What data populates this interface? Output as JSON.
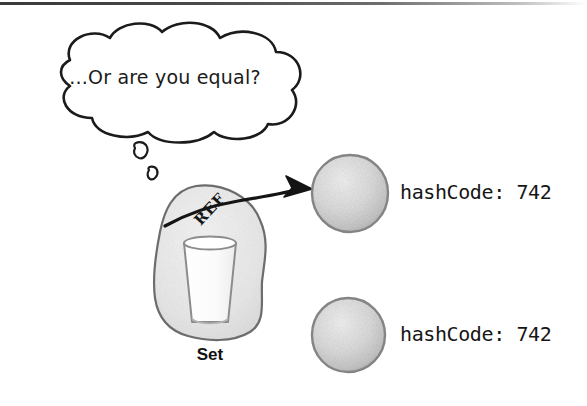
{
  "figure": {
    "kind": "hand-drawn-illustration",
    "caption_text": "...Or are you equal?",
    "set_label": "Set",
    "reference_label": "REF",
    "objects": [
      {
        "id": "object-top",
        "label": "hashCode: 742"
      },
      {
        "id": "object-bottom",
        "label": "hashCode: 742"
      }
    ]
  },
  "thought_bubble": {
    "text": "...Or are you equal?",
    "trail_bubbles": 2
  },
  "set_container": {
    "label": "Set",
    "contains_reference_label": "REF"
  },
  "arrow": {
    "name": "reference-arrow",
    "from": "REF in Set",
    "to": "object-top"
  },
  "colors": {
    "ink": "#1b1b1b",
    "blob_fill": "#ededed",
    "blob_stroke": "#6f6f6f",
    "circle_fill": "#dedede",
    "circle_stroke": "#8a8a8a",
    "cup_fill": "#fdfdfd",
    "cup_stroke": "#8c8c8c",
    "background": "#ffffff"
  }
}
